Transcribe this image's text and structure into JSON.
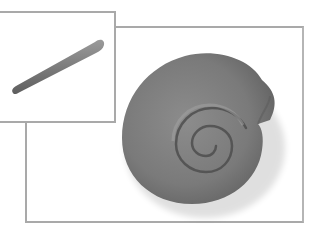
{
  "illustration": {
    "description": "Two-step clay craft illustration",
    "steps": [
      {
        "step": 1,
        "subject": "tapered clay coil",
        "frame": "inset-top-left"
      },
      {
        "step": 2,
        "subject": "coil rolled into spiral snail shell",
        "frame": "main"
      }
    ],
    "colors": {
      "clay": "#7b7b7b",
      "clay_highlight": "#9a9a9a",
      "clay_shadow": "#555555",
      "frame_border": "#a9a9a9",
      "background": "#ffffff"
    }
  }
}
